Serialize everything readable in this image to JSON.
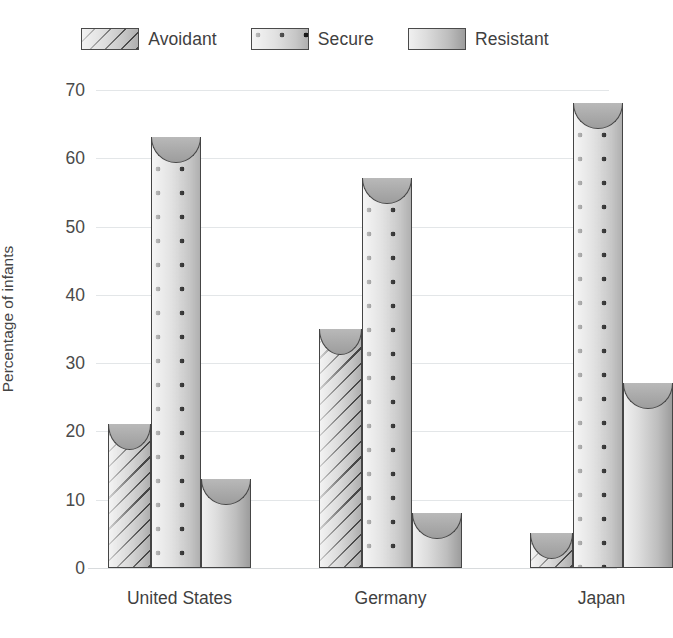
{
  "chart_data": {
    "type": "bar",
    "title": "",
    "subtitle": "",
    "xlabel": "",
    "ylabel": "Percentage of infants",
    "categories": [
      "United States",
      "Germany",
      "Japan"
    ],
    "series": [
      {
        "name": "Avoidant",
        "pattern": "diagonal-stripes",
        "values": [
          21,
          35,
          5
        ]
      },
      {
        "name": "Secure",
        "pattern": "dots",
        "values": [
          63,
          57,
          68
        ]
      },
      {
        "name": "Resistant",
        "pattern": "solid-gradient",
        "values": [
          13,
          8,
          27
        ]
      }
    ],
    "ylim": [
      0,
      70
    ],
    "yticks": [
      0,
      10,
      20,
      30,
      40,
      50,
      60,
      70
    ],
    "ytick_labels": [
      "0",
      "10",
      "20",
      "30",
      "40",
      "50",
      "60",
      "70"
    ],
    "grid": true,
    "grid_axis": "y",
    "legend_position": "top-center",
    "bar_style": "3d-cylinder",
    "colors": {
      "bar_outline": "#454545",
      "bar_fill_light": "#d3d3d3",
      "bar_fill_dark": "#9d9d9d",
      "gridline": "#e3e6e8",
      "text": "#3f3f3f",
      "background": "#ffffff"
    }
  },
  "legend": {
    "items": [
      {
        "label": "Avoidant",
        "swatch": "avoidant-swatch"
      },
      {
        "label": "Secure",
        "swatch": "secure-swatch"
      },
      {
        "label": "Resistant",
        "swatch": "resistant-swatch"
      }
    ]
  }
}
